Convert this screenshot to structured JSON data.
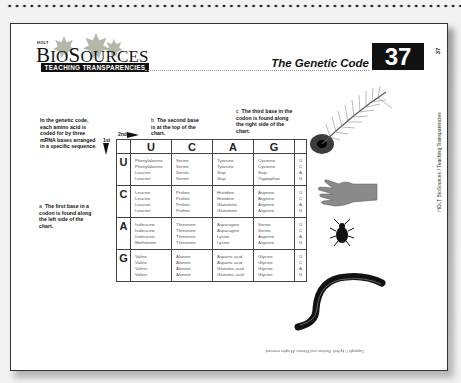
{
  "header": {
    "publisher": "HOLT",
    "brand_prefix": "B",
    "brand_io": "IO",
    "brand_s": "S",
    "brand_rest": "OURCES",
    "series": "TEACHING TRANSPARENCIES",
    "title": "The Genetic Code",
    "number": "37"
  },
  "side_label": {
    "number": "37",
    "text": "HOLT BioSources / Teaching Transparencies"
  },
  "notes": {
    "intro": "In the genetic code, each amino acid is coded for by three mRNA bases arranged in a specific sequence.",
    "a_letter": "a",
    "a_text": "The first base in a codon is found along the left side of the chart.",
    "b_letter": "b",
    "b_text": "The second base is at the top of the chart.",
    "c_letter": "c",
    "c_text": "The third base in the codon is found along the right side of the chart."
  },
  "axis_labels": {
    "second": "2nd",
    "first": "1st"
  },
  "table": {
    "second_bases": [
      "U",
      "C",
      "A",
      "G"
    ],
    "third_bases": [
      "U",
      "C",
      "A",
      "G"
    ],
    "rows": [
      {
        "first": "U",
        "cells": [
          [
            "Phenylalanine",
            "Phenylalanine",
            "Leucine",
            "Leucine"
          ],
          [
            "Serine",
            "Serine",
            "Serine",
            "Serine"
          ],
          [
            "Tyrosine",
            "Tyrosine",
            "Stop",
            "Stop"
          ],
          [
            "Cysteine",
            "Cysteine",
            "Stop",
            "Tryptophan"
          ]
        ]
      },
      {
        "first": "C",
        "cells": [
          [
            "Leucine",
            "Leucine",
            "Leucine",
            "Leucine"
          ],
          [
            "Proline",
            "Proline",
            "Proline",
            "Proline"
          ],
          [
            "Histidine",
            "Histidine",
            "Glutamine",
            "Glutamine"
          ],
          [
            "Arginine",
            "Arginine",
            "Arginine",
            "Arginine"
          ]
        ]
      },
      {
        "first": "A",
        "cells": [
          [
            "Isoleucine",
            "Isoleucine",
            "Isoleucine",
            "Methionine"
          ],
          [
            "Threonine",
            "Threonine",
            "Threonine",
            "Threonine"
          ],
          [
            "Asparagine",
            "Asparagine",
            "Lysine",
            "Lysine"
          ],
          [
            "Serine",
            "Serine",
            "Arginine",
            "Arginine"
          ]
        ]
      },
      {
        "first": "G",
        "cells": [
          [
            "Valine",
            "Valine",
            "Valine",
            "Valine"
          ],
          [
            "Alanine",
            "Alanine",
            "Alanine",
            "Alanine"
          ],
          [
            "Aspartic acid",
            "Aspartic acid",
            "Glutamic acid",
            "Glutamic acid"
          ],
          [
            "Glycine",
            "Glycine",
            "Glycine",
            "Glycine"
          ]
        ]
      }
    ]
  },
  "images": [
    "peacock-feather",
    "human-hand",
    "beetle",
    "earthworm"
  ],
  "footer_copyright": "Copyright © by Holt, Rinehart and Winston. All rights reserved."
}
